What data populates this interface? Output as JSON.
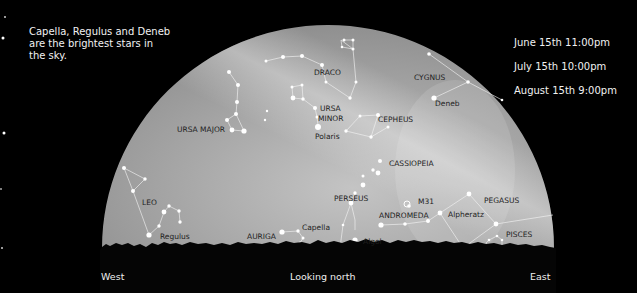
{
  "caption_left": "Capella, Regulus and Deneb\nare the brightest stars in\nthe sky.",
  "caption_right": [
    "June 15th 11:00pm",
    "July 15th 10:00pm",
    "August 15th 9:00pm"
  ],
  "directions": {
    "west": "West",
    "center": "Looking north",
    "east": "East"
  },
  "colors": {
    "background": "#000000",
    "sky_dark": "#8a8a8a",
    "sky_light": "#d8d8d8",
    "stars": "#ffffff",
    "labels": "#1e1e1e",
    "horizon": "#050505"
  },
  "constellations": [
    {
      "name": "DRACO",
      "label_pos": [
        314,
        75
      ]
    },
    {
      "name": "URSA MAJOR",
      "label_pos": [
        177,
        132
      ]
    },
    {
      "name": "URSA",
      "label_pos": [
        320,
        111
      ]
    },
    {
      "name": "MINOR",
      "label_pos": [
        318,
        121
      ]
    },
    {
      "name": "CEPHEUS",
      "label_pos": [
        378,
        122
      ]
    },
    {
      "name": "CYGNUS",
      "label_pos": [
        414,
        80
      ]
    },
    {
      "name": "CASSIOPEIA",
      "label_pos": [
        389,
        166
      ]
    },
    {
      "name": "LEO",
      "label_pos": [
        142,
        205
      ]
    },
    {
      "name": "PERSEUS",
      "label_pos": [
        334,
        201
      ]
    },
    {
      "name": "M31",
      "label_pos": [
        418,
        204
      ]
    },
    {
      "name": "ANDROMEDA",
      "label_pos": [
        379,
        218
      ]
    },
    {
      "name": "PEGASUS",
      "label_pos": [
        484,
        203
      ]
    },
    {
      "name": "AURIGA",
      "label_pos": [
        247,
        239
      ]
    },
    {
      "name": "PISCES",
      "label_pos": [
        506,
        237
      ]
    }
  ],
  "stars_named": [
    {
      "name": "Deneb",
      "label_pos": [
        435,
        106
      ]
    },
    {
      "name": "Polaris",
      "label_pos": [
        315,
        139
      ]
    },
    {
      "name": "Regulus",
      "label_pos": [
        160,
        239
      ]
    },
    {
      "name": "Capella",
      "label_pos": [
        302,
        230
      ]
    },
    {
      "name": "Algol",
      "label_pos": [
        363,
        244
      ]
    },
    {
      "name": "Alpheratz",
      "label_pos": [
        448,
        217
      ]
    }
  ]
}
